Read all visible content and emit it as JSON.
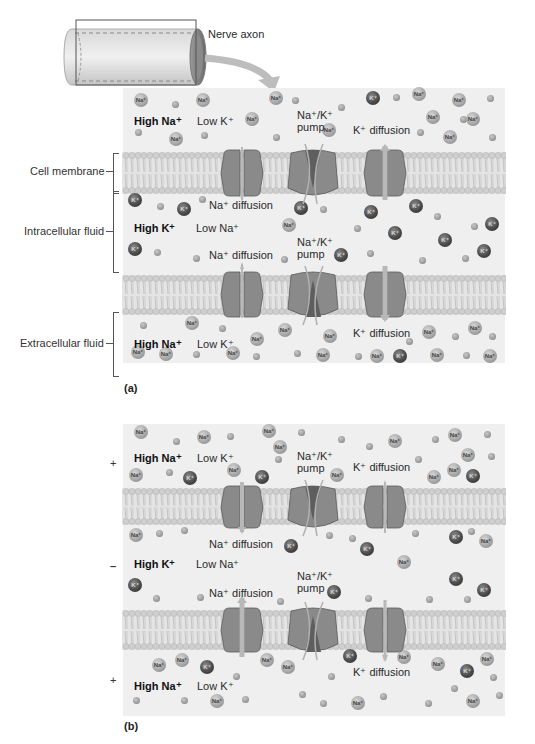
{
  "axon": {
    "label": "Nerve axon"
  },
  "side_labels": {
    "cell_membrane": "Cell membrane",
    "intracellular": "Intracellular fluid",
    "extracellular": "Extracellular fluid"
  },
  "panel_a": {
    "caption": "(a)",
    "top_high": "High Na⁺",
    "top_low": "Low K⁺",
    "pump_top": "Na⁺/K⁺\npump",
    "kdiff_top": "K⁺ diffusion",
    "nadiff_upper": "Na⁺ diffusion",
    "mid_high": "High K⁺",
    "mid_low": "Low Na⁺",
    "pump_mid": "Na⁺/K⁺\npump",
    "nadiff_lower": "Na⁺ diffusion",
    "bot_high": "High Na⁺",
    "bot_low": "Low K⁺",
    "kdiff_bot": "K⁺ diffusion"
  },
  "panel_b": {
    "caption": "(b)",
    "sign_top": "+",
    "sign_mid": "–",
    "sign_bot": "+",
    "top_high": "High Na⁺",
    "top_low": "Low K⁺",
    "pump_top": "Na⁺/K⁺\npump",
    "kdiff_top": "K⁺ diffusion",
    "nadiff_upper": "Na⁺ diffusion",
    "mid_high": "High K⁺",
    "mid_low": "Low Na⁺",
    "pump_mid": "Na⁺/K⁺\npump",
    "nadiff_lower": "Na⁺ diffusion",
    "bot_high": "High Na⁺",
    "bot_low": "Low K⁺",
    "kdiff_bot": "K⁺ diffusion"
  },
  "ion_labels": {
    "na": "Na⁺",
    "k": "K⁺"
  },
  "colors": {
    "background": "#ffffff",
    "fluid": "#efefef",
    "membrane_head": "#c9c9c9",
    "channel": "#7a7a7a",
    "arrow": "#b8b8b8",
    "na_ion": "#a8a8a8",
    "k_ion": "#4a4a4a"
  },
  "ions": {
    "a": [
      [
        "na",
        141,
        100
      ],
      [
        "neg",
        175,
        104
      ],
      [
        "na",
        203,
        100
      ],
      [
        "na",
        276,
        98
      ],
      [
        "neg",
        295,
        100
      ],
      [
        "neg",
        341,
        107
      ],
      [
        "k",
        373,
        98
      ],
      [
        "neg",
        396,
        97
      ],
      [
        "na",
        419,
        94
      ],
      [
        "na",
        459,
        100
      ],
      [
        "neg",
        490,
        98
      ],
      [
        "na",
        252,
        119
      ],
      [
        "na",
        433,
        117
      ],
      [
        "neg",
        463,
        119
      ],
      [
        "na",
        473,
        119
      ],
      [
        "neg",
        138,
        132
      ],
      [
        "na",
        176,
        139
      ],
      [
        "neg",
        204,
        135
      ],
      [
        "neg",
        276,
        137
      ],
      [
        "na",
        329,
        130
      ],
      [
        "neg",
        420,
        132
      ],
      [
        "na",
        450,
        137
      ],
      [
        "neg",
        492,
        137
      ],
      [
        "k",
        135,
        200
      ],
      [
        "neg",
        160,
        206
      ],
      [
        "neg",
        202,
        199
      ],
      [
        "k",
        184,
        209
      ],
      [
        "k",
        301,
        208
      ],
      [
        "neg",
        323,
        209
      ],
      [
        "k",
        371,
        212
      ],
      [
        "k",
        416,
        206
      ],
      [
        "neg",
        437,
        216
      ],
      [
        "na",
        289,
        225
      ],
      [
        "neg",
        357,
        228
      ],
      [
        "k",
        492,
        224
      ],
      [
        "neg",
        474,
        226
      ],
      [
        "k",
        395,
        233
      ],
      [
        "k",
        445,
        240
      ],
      [
        "k",
        135,
        249
      ],
      [
        "neg",
        157,
        252
      ],
      [
        "neg",
        196,
        258
      ],
      [
        "k",
        341,
        255
      ],
      [
        "neg",
        284,
        259
      ],
      [
        "neg",
        370,
        253
      ],
      [
        "neg",
        422,
        260
      ],
      [
        "neg",
        465,
        258
      ],
      [
        "k",
        484,
        251
      ],
      [
        "neg",
        143,
        325
      ],
      [
        "na",
        192,
        323
      ],
      [
        "neg",
        222,
        328
      ],
      [
        "na",
        285,
        330
      ],
      [
        "na",
        330,
        336
      ],
      [
        "na",
        257,
        339
      ],
      [
        "na",
        475,
        328
      ],
      [
        "na",
        429,
        332
      ],
      [
        "neg",
        455,
        336
      ],
      [
        "neg",
        409,
        341
      ],
      [
        "neg",
        492,
        336
      ],
      [
        "na",
        138,
        352
      ],
      [
        "na",
        166,
        354
      ],
      [
        "neg",
        196,
        354
      ],
      [
        "na",
        233,
        353
      ],
      [
        "neg",
        256,
        356
      ],
      [
        "neg",
        297,
        353
      ],
      [
        "na",
        323,
        355
      ],
      [
        "neg",
        358,
        356
      ],
      [
        "na",
        377,
        356
      ],
      [
        "k",
        400,
        356
      ],
      [
        "na",
        437,
        355
      ],
      [
        "neg",
        466,
        355
      ],
      [
        "na",
        490,
        356
      ]
    ],
    "b": [
      [
        "na",
        141,
        432
      ],
      [
        "neg",
        176,
        441
      ],
      [
        "na",
        204,
        437
      ],
      [
        "na",
        269,
        431
      ],
      [
        "neg",
        230,
        436
      ],
      [
        "na",
        280,
        447
      ],
      [
        "neg",
        301,
        432
      ],
      [
        "neg",
        341,
        439
      ],
      [
        "neg",
        369,
        446
      ],
      [
        "na",
        395,
        441
      ],
      [
        "neg",
        435,
        439
      ],
      [
        "na",
        455,
        435
      ],
      [
        "neg",
        487,
        434
      ],
      [
        "neg",
        278,
        459
      ],
      [
        "neg",
        418,
        459
      ],
      [
        "na",
        468,
        455
      ],
      [
        "neg",
        491,
        456
      ],
      [
        "na",
        136,
        475
      ],
      [
        "neg",
        169,
        472
      ],
      [
        "k",
        190,
        478
      ],
      [
        "na",
        234,
        470
      ],
      [
        "k",
        262,
        477
      ],
      [
        "na",
        337,
        475
      ],
      [
        "na",
        434,
        477
      ],
      [
        "na",
        454,
        470
      ],
      [
        "k",
        473,
        476
      ],
      [
        "na",
        136,
        535
      ],
      [
        "neg",
        159,
        533
      ],
      [
        "neg",
        184,
        530
      ],
      [
        "k",
        291,
        546
      ],
      [
        "neg",
        329,
        535
      ],
      [
        "neg",
        352,
        538
      ],
      [
        "k",
        367,
        549
      ],
      [
        "neg",
        415,
        533
      ],
      [
        "k",
        456,
        537
      ],
      [
        "neg",
        471,
        531
      ],
      [
        "na",
        486,
        541
      ],
      [
        "na",
        404,
        562
      ],
      [
        "k",
        135,
        585
      ],
      [
        "k",
        456,
        579
      ],
      [
        "k",
        484,
        590
      ],
      [
        "neg",
        156,
        598
      ],
      [
        "neg",
        200,
        597
      ],
      [
        "neg",
        280,
        601
      ],
      [
        "k",
        334,
        592
      ],
      [
        "neg",
        368,
        598
      ],
      [
        "neg",
        429,
        599
      ],
      [
        "neg",
        467,
        599
      ],
      [
        "na",
        159,
        665
      ],
      [
        "na",
        182,
        660
      ],
      [
        "k",
        207,
        667
      ],
      [
        "na",
        267,
        660
      ],
      [
        "na",
        288,
        667
      ],
      [
        "k",
        350,
        656
      ],
      [
        "na",
        404,
        657
      ],
      [
        "na",
        438,
        664
      ],
      [
        "k",
        467,
        671
      ],
      [
        "na",
        487,
        659
      ],
      [
        "neg",
        236,
        676
      ],
      [
        "neg",
        331,
        676
      ],
      [
        "neg",
        493,
        677
      ],
      [
        "neg",
        454,
        688
      ],
      [
        "neg",
        136,
        700
      ],
      [
        "neg",
        184,
        700
      ],
      [
        "na",
        217,
        701
      ],
      [
        "neg",
        245,
        699
      ],
      [
        "neg",
        302,
        694
      ],
      [
        "neg",
        323,
        703
      ],
      [
        "na",
        358,
        703
      ],
      [
        "neg",
        383,
        696
      ],
      [
        "neg",
        428,
        703
      ],
      [
        "na",
        473,
        701
      ],
      [
        "neg",
        499,
        695
      ]
    ]
  }
}
